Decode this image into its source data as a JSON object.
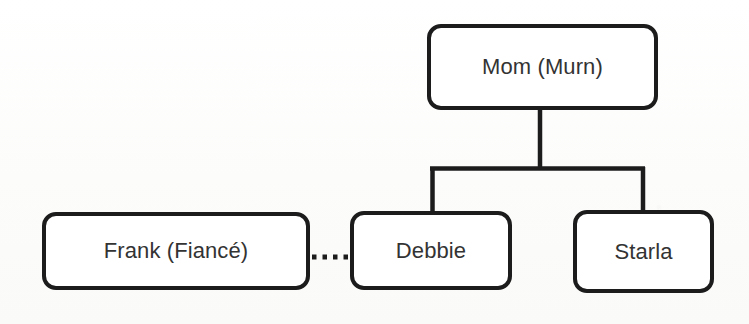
{
  "diagram": {
    "type": "family-tree",
    "background_color": "#fdfdfc",
    "line_color": "#1c1c1c",
    "text_color": "#333333",
    "nodes": [
      {
        "id": "mom",
        "label": "Mom (Murn)",
        "x": 427,
        "y": 24,
        "width": 231,
        "height": 86
      },
      {
        "id": "frank",
        "label": "Frank (Fiancé)",
        "x": 42,
        "y": 212,
        "width": 268,
        "height": 78
      },
      {
        "id": "debbie",
        "label": "Debbie",
        "x": 350,
        "y": 211,
        "width": 162,
        "height": 79
      },
      {
        "id": "starla",
        "label": "Starla",
        "x": 573,
        "y": 210,
        "width": 141,
        "height": 83
      }
    ],
    "edges": [
      {
        "id": "mom-to-children",
        "from": "mom",
        "to": [
          "debbie",
          "starla"
        ],
        "style": "solid",
        "kind": "parent-child"
      },
      {
        "id": "frank-debbie",
        "from": "frank",
        "to": [
          "debbie"
        ],
        "style": "dotted",
        "kind": "engaged"
      }
    ]
  }
}
